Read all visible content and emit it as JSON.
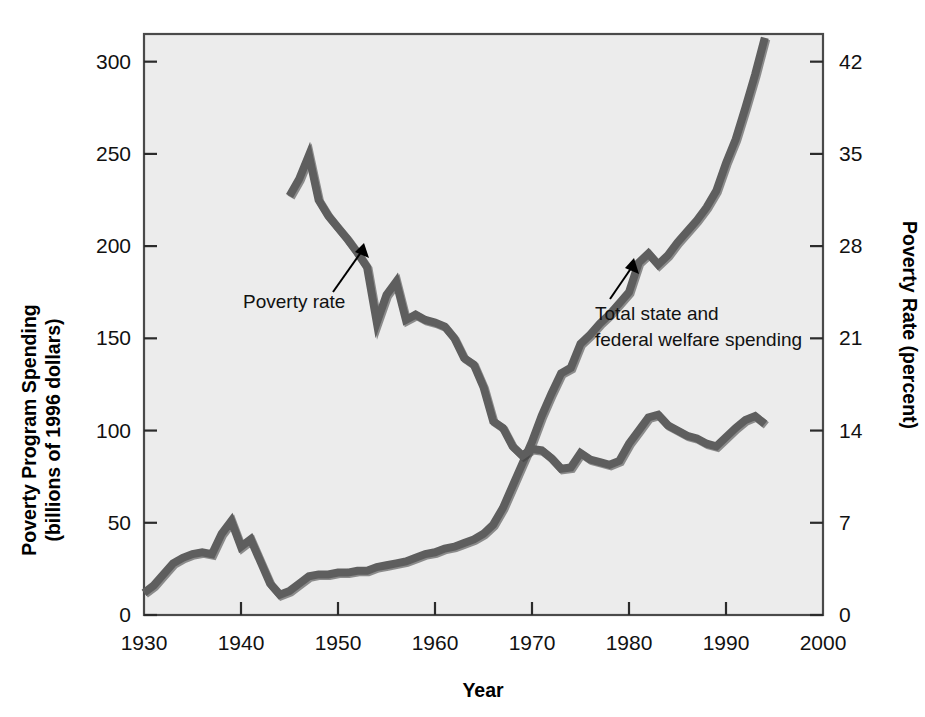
{
  "chart_data": {
    "type": "line",
    "title": "",
    "xlabel": "Year",
    "ylabel": "Poverty Program Spending\n(billions of 1996 dollars)",
    "ylabel_line1": "Poverty Program Spending",
    "ylabel_line2": "(billions of 1996 dollars)",
    "y2label": "Poverty Rate (percent)",
    "xlim": [
      1930,
      2000
    ],
    "ylim": [
      0,
      315
    ],
    "y2lim": [
      0,
      44.1
    ],
    "grid": false,
    "legend_position": "inline-annotations",
    "xticks": [
      1930,
      1940,
      1950,
      1960,
      1970,
      1980,
      1990,
      2000
    ],
    "xtick_labels": [
      "1930",
      "1940",
      "1950",
      "1960",
      "1970",
      "1980",
      "1990",
      "2000"
    ],
    "yticks": [
      0,
      50,
      100,
      150,
      200,
      250,
      300
    ],
    "ytick_labels": [
      "0",
      "50",
      "100",
      "150",
      "200",
      "250",
      "300"
    ],
    "y2ticks": [
      0,
      7,
      14,
      21,
      28,
      35,
      42
    ],
    "y2tick_labels": [
      "0",
      "7",
      "14",
      "21",
      "28",
      "35",
      "42"
    ],
    "series": [
      {
        "name": "Total state and federal welfare spending",
        "axis": "left",
        "units": "billions of 1996 dollars",
        "color": "#585858",
        "x": [
          1930,
          1931,
          1932,
          1933,
          1934,
          1935,
          1936,
          1937,
          1938,
          1939,
          1940,
          1941,
          1942,
          1943,
          1944,
          1945,
          1946,
          1947,
          1948,
          1949,
          1950,
          1951,
          1952,
          1953,
          1954,
          1955,
          1956,
          1957,
          1958,
          1959,
          1960,
          1961,
          1962,
          1963,
          1964,
          1965,
          1966,
          1967,
          1968,
          1969,
          1970,
          1971,
          1972,
          1973,
          1974,
          1975,
          1976,
          1977,
          1978,
          1979,
          1980,
          1981,
          1982,
          1983,
          1984,
          1985,
          1986,
          1987,
          1988,
          1989,
          1990,
          1991,
          1992,
          1993,
          1994
        ],
        "y": [
          12,
          16,
          22,
          28,
          31,
          33,
          34,
          33,
          44,
          51,
          37,
          41,
          29,
          17,
          11,
          13,
          17,
          21,
          22,
          22,
          23,
          23,
          24,
          24,
          26,
          27,
          28,
          29,
          31,
          33,
          34,
          36,
          37,
          39,
          41,
          44,
          49,
          58,
          70,
          82,
          94,
          108,
          120,
          131,
          134,
          147,
          152,
          158,
          163,
          169,
          175,
          191,
          196,
          190,
          195,
          202,
          208,
          214,
          221,
          230,
          245,
          258,
          275,
          293,
          313
        ]
      },
      {
        "name": "Poverty rate",
        "axis": "right",
        "units": "percent",
        "color": "#6b6b6b",
        "x": [
          1945,
          1946,
          1947,
          1948,
          1949,
          1950,
          1951,
          1952,
          1953,
          1954,
          1955,
          1956,
          1957,
          1958,
          1959,
          1960,
          1961,
          1962,
          1963,
          1964,
          1965,
          1966,
          1967,
          1968,
          1969,
          1970,
          1971,
          1972,
          1973,
          1974,
          1975,
          1976,
          1977,
          1978,
          1979,
          1980,
          1981,
          1982,
          1983,
          1984,
          1985,
          1986,
          1987,
          1988,
          1989,
          1990,
          1991,
          1992,
          1993,
          1994
        ],
        "y": [
          31.8,
          33.1,
          34.9,
          31.5,
          30.3,
          29.4,
          28.5,
          27.5,
          26.4,
          22.2,
          24.3,
          25.3,
          22.4,
          22.8,
          22.4,
          22.2,
          21.9,
          21.0,
          19.5,
          19.0,
          17.3,
          14.7,
          14.2,
          12.8,
          12.1,
          12.6,
          12.5,
          11.9,
          11.1,
          11.2,
          12.3,
          11.8,
          11.6,
          11.4,
          11.7,
          13.0,
          14.0,
          15.0,
          15.2,
          14.4,
          14.0,
          13.6,
          13.4,
          13.0,
          12.8,
          13.5,
          14.2,
          14.8,
          15.1,
          14.5
        ]
      }
    ],
    "annotations": [
      {
        "text": "Poverty rate",
        "lines": [
          "Poverty rate"
        ],
        "target_series": "Poverty rate",
        "arrow": true
      },
      {
        "text": "Total state and federal welfare spending",
        "lines": [
          "Total state and",
          "federal welfare spending"
        ],
        "target_series": "Total state and federal welfare spending",
        "arrow": true
      }
    ],
    "colors": {
      "plot_background": "#ececec",
      "page_background": "#ffffff",
      "frame": "#4a4a4a",
      "text": "#111111",
      "line": "#585858"
    }
  }
}
